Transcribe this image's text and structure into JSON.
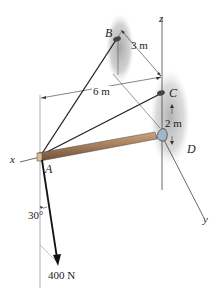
{
  "figure": {
    "points": {
      "A": "A",
      "B": "B",
      "C": "C",
      "D": "D"
    },
    "axes": {
      "x": "x",
      "y": "y",
      "z": "z"
    },
    "dimensions": {
      "BC": "3 m",
      "A_to_z": "6 m",
      "CD": "2 m"
    },
    "force": {
      "magnitude": "400 N",
      "angle": "30°"
    },
    "colors": {
      "rod": "#a07a5a",
      "rod_dark": "#6e5038",
      "wall_shadow": "#b8b8b8",
      "joint": "#9fb7c9",
      "line": "#222222"
    }
  }
}
